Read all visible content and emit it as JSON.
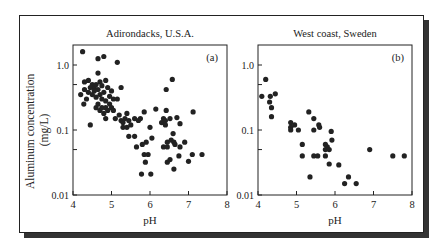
{
  "figure": {
    "ylabel_line1": "Aluminum concentration",
    "ylabel_line2": "(mg/L)",
    "xlabel": "pH"
  },
  "chart_data": [
    {
      "type": "scatter",
      "title": "Adirondacks, U.S.A.",
      "panel_label": "(a)",
      "xlabel": "pH",
      "ylabel": "Aluminum concentration (mg/L)",
      "yscale": "log",
      "xlim": [
        4,
        8
      ],
      "ylim": [
        0.01,
        2
      ],
      "xticks": [
        4,
        5,
        6,
        7,
        8
      ],
      "yticks": [
        "0.01",
        "0.1",
        "1.0"
      ],
      "points": [
        [
          4.25,
          1.6
        ],
        [
          4.65,
          1.25
        ],
        [
          4.8,
          1.35
        ],
        [
          5.15,
          1.1
        ],
        [
          4.65,
          0.75
        ],
        [
          4.3,
          0.55
        ],
        [
          4.4,
          0.58
        ],
        [
          4.5,
          0.5
        ],
        [
          4.55,
          0.45
        ],
        [
          4.6,
          0.5
        ],
        [
          4.7,
          0.55
        ],
        [
          4.75,
          0.48
        ],
        [
          4.85,
          0.58
        ],
        [
          4.9,
          0.45
        ],
        [
          5.0,
          0.4
        ],
        [
          5.25,
          0.45
        ],
        [
          4.2,
          0.35
        ],
        [
          4.3,
          0.42
        ],
        [
          4.35,
          0.3
        ],
        [
          4.4,
          0.38
        ],
        [
          4.45,
          0.45
        ],
        [
          4.5,
          0.35
        ],
        [
          4.55,
          0.4
        ],
        [
          4.6,
          0.32
        ],
        [
          4.65,
          0.42
        ],
        [
          4.7,
          0.35
        ],
        [
          4.75,
          0.3
        ],
        [
          4.8,
          0.38
        ],
        [
          4.85,
          0.28
        ],
        [
          4.95,
          0.33
        ],
        [
          5.05,
          0.3
        ],
        [
          5.15,
          0.3
        ],
        [
          4.28,
          0.25
        ],
        [
          4.6,
          0.22
        ],
        [
          4.65,
          0.25
        ],
        [
          4.7,
          0.2
        ],
        [
          4.75,
          0.22
        ],
        [
          4.8,
          0.18
        ],
        [
          4.85,
          0.22
        ],
        [
          4.9,
          0.2
        ],
        [
          4.95,
          0.25
        ],
        [
          5.0,
          0.22
        ],
        [
          5.05,
          0.2
        ],
        [
          4.45,
          0.12
        ],
        [
          4.85,
          0.15
        ],
        [
          5.1,
          0.15
        ],
        [
          5.2,
          0.17
        ],
        [
          5.25,
          0.14
        ],
        [
          5.3,
          0.13
        ],
        [
          5.35,
          0.15
        ],
        [
          5.4,
          0.18
        ],
        [
          5.45,
          0.14
        ],
        [
          5.5,
          0.12
        ],
        [
          5.6,
          0.15
        ],
        [
          5.7,
          0.14
        ],
        [
          5.75,
          0.15
        ],
        [
          5.3,
          0.11
        ],
        [
          5.4,
          0.11
        ],
        [
          5.45,
          0.08
        ],
        [
          5.6,
          0.08
        ],
        [
          5.65,
          0.055
        ],
        [
          5.85,
          0.19
        ],
        [
          6.15,
          0.21
        ],
        [
          6.0,
          0.11
        ],
        [
          6.05,
          0.075
        ],
        [
          5.8,
          0.06
        ],
        [
          5.9,
          0.065
        ],
        [
          5.85,
          0.042
        ],
        [
          5.95,
          0.042
        ],
        [
          5.88,
          0.032
        ],
        [
          5.78,
          0.021
        ],
        [
          6.02,
          0.021
        ],
        [
          6.3,
          0.13
        ],
        [
          6.35,
          0.15
        ],
        [
          6.4,
          0.14
        ],
        [
          6.4,
          0.12
        ],
        [
          6.42,
          0.2
        ],
        [
          6.42,
          0.42
        ],
        [
          6.58,
          0.6
        ],
        [
          6.52,
          0.15
        ],
        [
          6.7,
          0.155
        ],
        [
          6.78,
          0.125
        ],
        [
          7.12,
          0.19
        ],
        [
          6.35,
          0.055
        ],
        [
          6.45,
          0.055
        ],
        [
          6.45,
          0.065
        ],
        [
          6.55,
          0.07
        ],
        [
          6.62,
          0.065
        ],
        [
          6.6,
          0.088
        ],
        [
          6.65,
          0.06
        ],
        [
          6.78,
          0.055
        ],
        [
          6.9,
          0.065
        ],
        [
          6.45,
          0.032
        ],
        [
          6.52,
          0.035
        ],
        [
          6.75,
          0.04
        ],
        [
          6.62,
          0.025
        ],
        [
          7.0,
          0.033
        ],
        [
          7.1,
          0.042
        ],
        [
          7.35,
          0.042
        ]
      ]
    },
    {
      "type": "scatter",
      "title": "West coast, Sweden",
      "panel_label": "(b)",
      "xlabel": "pH",
      "ylabel": "Aluminum concentration (mg/L)",
      "yscale": "log",
      "xlim": [
        4,
        8
      ],
      "ylim": [
        0.01,
        2
      ],
      "xticks": [
        4,
        5,
        6,
        7,
        8
      ],
      "yticks": [
        "0.01",
        "0.1",
        "1.0"
      ],
      "points": [
        [
          4.1,
          0.33
        ],
        [
          4.2,
          0.6
        ],
        [
          4.3,
          0.27
        ],
        [
          4.32,
          0.33
        ],
        [
          4.35,
          0.22
        ],
        [
          4.35,
          0.16
        ],
        [
          4.45,
          0.36
        ],
        [
          4.85,
          0.13
        ],
        [
          4.85,
          0.11
        ],
        [
          4.85,
          0.1
        ],
        [
          4.95,
          0.12
        ],
        [
          5.05,
          0.1
        ],
        [
          5.15,
          0.06
        ],
        [
          5.15,
          0.04
        ],
        [
          5.32,
          0.19
        ],
        [
          5.35,
          0.019
        ],
        [
          5.45,
          0.15
        ],
        [
          5.45,
          0.1
        ],
        [
          5.45,
          0.04
        ],
        [
          5.55,
          0.04
        ],
        [
          5.58,
          0.12
        ],
        [
          5.6,
          0.11
        ],
        [
          5.75,
          0.06
        ],
        [
          5.75,
          0.05
        ],
        [
          5.75,
          0.04
        ],
        [
          5.8,
          0.055
        ],
        [
          5.85,
          0.05
        ],
        [
          5.85,
          0.03
        ],
        [
          5.9,
          0.095
        ],
        [
          5.92,
          0.07
        ],
        [
          6.1,
          0.029
        ],
        [
          6.25,
          0.015
        ],
        [
          6.35,
          0.019
        ],
        [
          6.55,
          0.015
        ],
        [
          6.9,
          0.05
        ],
        [
          7.5,
          0.04
        ],
        [
          7.8,
          0.04
        ]
      ]
    }
  ]
}
